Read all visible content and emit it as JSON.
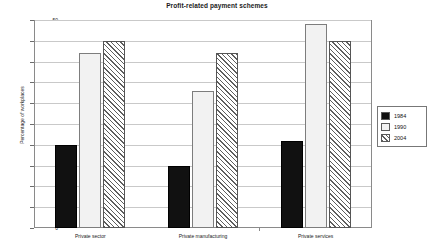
{
  "chart_data": {
    "type": "bar",
    "title": "Profit-related payment schemes",
    "xlabel": "",
    "ylabel": "Percentage of workplaces",
    "categories": [
      "Private sector",
      "Private manufacturing",
      "Private services"
    ],
    "series": [
      {
        "name": "1984",
        "values": [
          20,
          15,
          21
        ],
        "fill": "solid-black",
        "color": "#111111"
      },
      {
        "name": "1990",
        "values": [
          42,
          33,
          49
        ],
        "fill": "light-dotted",
        "color": "#f2f2f2"
      },
      {
        "name": "2004",
        "values": [
          45,
          42,
          45
        ],
        "fill": "diagonal-hatch",
        "color": "#ffffff"
      }
    ],
    "ylim": [
      0,
      50
    ],
    "ytick_step": 5,
    "yticks": [
      "0",
      "5",
      "10",
      "15",
      "20",
      "25",
      "30",
      "35",
      "40",
      "45",
      "50"
    ],
    "grid": true,
    "legend_position": "right"
  },
  "legend": {
    "entries": [
      {
        "label": "1984"
      },
      {
        "label": "1990"
      },
      {
        "label": "2004"
      }
    ]
  }
}
